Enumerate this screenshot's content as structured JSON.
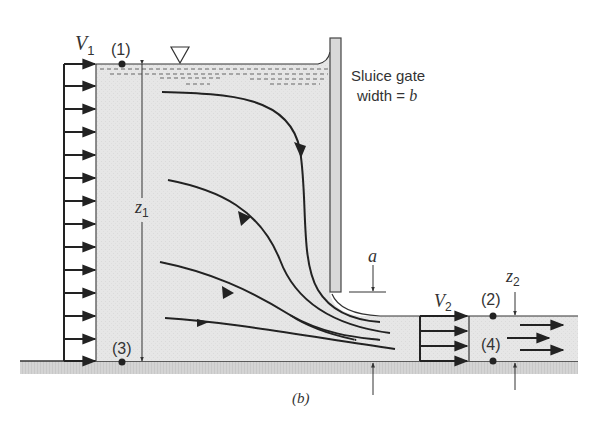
{
  "figure": {
    "caption": "(b)",
    "colors": {
      "water": "#e4e4e4",
      "ground": "#d2d2d2",
      "line": "#222222",
      "text": "#333333",
      "background": "#ffffff"
    }
  },
  "labels": {
    "v1": "V",
    "v1_sub": "1",
    "v2": "V",
    "v2_sub": "2",
    "z1": "z",
    "z1_sub": "1",
    "z2": "z",
    "z2_sub": "2",
    "a": "a",
    "gate_line1": "Sluice gate",
    "gate_line2_prefix": "width = ",
    "gate_line2_var": "b",
    "point1": "(1)",
    "point2": "(2)",
    "point3": "(3)",
    "point4": "(4)"
  },
  "icons": {
    "free_surface": "inverted-triangle-symbol"
  }
}
